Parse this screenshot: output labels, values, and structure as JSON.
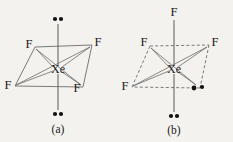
{
  "figure": {
    "background_color": "#f3f2ee",
    "ink_color": "#1a1a1a",
    "bond_color": "#4a4a4a"
  },
  "diagrams": [
    {
      "id": "a",
      "caption": "(a)",
      "center_atom": "Xe",
      "geometry": "square planar",
      "ligand_labels": [
        "F",
        "F",
        "F",
        "F"
      ],
      "ligands": [
        {
          "label": "F",
          "position": "top-left",
          "x": 29,
          "y": 46
        },
        {
          "label": "F",
          "position": "top-right",
          "x": 97,
          "y": 44
        },
        {
          "label": "F",
          "position": "bottom-left",
          "x": 9,
          "y": 86
        },
        {
          "label": "F",
          "position": "bottom-right",
          "x": 78,
          "y": 88
        }
      ],
      "lone_pairs": [
        {
          "position": "top",
          "x": 58,
          "y": 18,
          "dots": 2
        },
        {
          "position": "bottom",
          "x": 58,
          "y": 115,
          "dots": 2
        }
      ],
      "lone_pair_count": 2,
      "edge_style": "solid"
    },
    {
      "id": "b",
      "caption": "(b)",
      "center_atom": "Xe",
      "geometry": "see-saw / distorted",
      "ligand_labels": [
        "F",
        "F",
        "F",
        "F"
      ],
      "ligands": [
        {
          "label": "F",
          "position": "top",
          "x": 58,
          "y": 14
        },
        {
          "label": "F",
          "position": "top-left",
          "x": 28,
          "y": 44
        },
        {
          "label": "F",
          "position": "top-right",
          "x": 98,
          "y": 44
        },
        {
          "label": "F",
          "position": "bottom-left",
          "x": 10,
          "y": 87
        }
      ],
      "lone_pairs": [
        {
          "position": "equatorial-right",
          "x": 78,
          "y": 88,
          "dots": 2
        },
        {
          "position": "bottom",
          "x": 58,
          "y": 117,
          "dots": 2
        }
      ],
      "lone_pair_count": 2,
      "edge_style": "dashed"
    }
  ],
  "captions": {
    "left": "(a)",
    "right": "(b)"
  }
}
